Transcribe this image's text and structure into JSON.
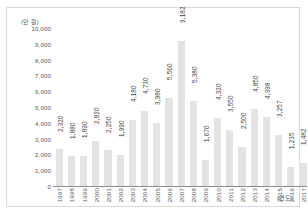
{
  "chart_data": {
    "type": "bar",
    "title": "",
    "subtitle": "",
    "xlabel": "(연도)",
    "ylabel": "(만 원)",
    "ylim": [
      0,
      10000
    ],
    "ytick_labels": [
      "10,000",
      "9,000",
      "8,000",
      "7,000",
      "6,000",
      "5,000",
      "4,000",
      "3,000",
      "2,000",
      "1,000",
      "0"
    ],
    "ytick_values": [
      10000,
      9000,
      8000,
      7000,
      6000,
      5000,
      4000,
      3000,
      2000,
      1000,
      0
    ],
    "grid": false,
    "legend": null,
    "bar_color": "#e3e3e3",
    "axis_color": "#8c8c8c",
    "categories": [
      "1997",
      "1998",
      "1999",
      "2000",
      "2001",
      "2002",
      "2003",
      "2004",
      "2005",
      "2006",
      "2007",
      "2008",
      "2009",
      "2010",
      "2011",
      "2012",
      "2013",
      "2014",
      "2015",
      "2016",
      "2017"
    ],
    "values": [
      2320,
      1880,
      1890,
      2820,
      2250,
      1990,
      4180,
      4730,
      3980,
      5560,
      9182,
      5380,
      1670,
      4320,
      3550,
      2500,
      4850,
      4398,
      3257,
      1235,
      1482
    ],
    "data_labels": [
      "2,320",
      "1,880",
      "1,890",
      "2,820",
      "2,250",
      "1,990",
      "4,180",
      "4,730",
      "3,980",
      "5,560",
      "9,182",
      "5,380",
      "1,670",
      "4,320",
      "3,550",
      "2,500",
      "4,850",
      "4,398",
      "3,257",
      "1,235",
      "1,482"
    ]
  }
}
